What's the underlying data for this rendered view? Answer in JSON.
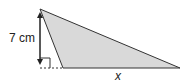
{
  "diagram": {
    "type": "obtuse-triangle-height",
    "colors": {
      "fill": "#d9d9d9",
      "stroke": "#333333",
      "background": "#ffffff"
    },
    "height_label": "7 cm",
    "base_label": "x",
    "points": {
      "apex": [
        40,
        9
      ],
      "base_left": [
        63,
        68
      ],
      "base_right": [
        180,
        68
      ],
      "foot": [
        40,
        68
      ]
    }
  }
}
